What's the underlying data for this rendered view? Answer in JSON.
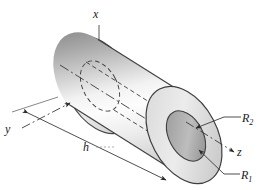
{
  "figure": {
    "type": "engineering-solid-diagram",
    "background_color": "#ffffff",
    "outline_color": "#3a3a3a",
    "shading": {
      "body_highlight": "#fdfdfd",
      "body_midtone": "#c9c9c9",
      "body_shadow": "#8f8f8f",
      "end_face_light": "#e6e6e6",
      "end_face_mid": "#cfcfcf",
      "bore_shadow": "#a8a8a8",
      "bore_dark": "#909090"
    }
  },
  "axes": [
    {
      "name": "x-axis",
      "label": "x",
      "direction": "vertical-up",
      "line_style": "solid",
      "label_position": {
        "x": 96,
        "y": 14
      }
    },
    {
      "name": "y-axis",
      "label": "y",
      "direction": "lower-left",
      "line_style": "dash-dot",
      "arrowhead": true,
      "label_position": {
        "x": 9,
        "y": 129
      }
    },
    {
      "name": "z-axis",
      "label": "z",
      "direction": "lower-right",
      "line_style": "dash-dot",
      "arrowhead": true,
      "label_position": {
        "x": 239,
        "y": 153
      }
    }
  ],
  "dimensions": [
    {
      "name": "height-dimension",
      "label": "h",
      "description": "overall axial length of the cylinder",
      "line_style": "solid-with-arrowheads",
      "arrowheads": "both-ends",
      "label_position": {
        "x": 87,
        "y": 148
      }
    },
    {
      "name": "outer-radius-callout",
      "label": "R",
      "subscript": "2",
      "description": "outer radius of the annular end face",
      "leader": "elbow-with-arrowhead",
      "label_position": {
        "x": 243,
        "y": 120
      }
    },
    {
      "name": "inner-radius-callout",
      "label": "R",
      "subscript": "1",
      "description": "inner bore radius of the annular end face",
      "leader": "elbow-with-arrowhead",
      "label_position": {
        "x": 243,
        "y": 178
      }
    }
  ],
  "hidden_geometry": {
    "line_style": "dashed",
    "items": [
      "far-end-outer-ellipse",
      "far-end-inner-bore-ellipse",
      "bore-top-generator",
      "bore-bottom-generator",
      "centerline"
    ]
  }
}
